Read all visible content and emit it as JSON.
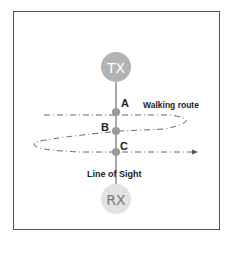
{
  "diagram": {
    "transmitter": {
      "label": "TX",
      "color": "#b3b3b3"
    },
    "receiver": {
      "label": "RX",
      "color": "#e2e2e2",
      "text_color": "#777777"
    },
    "points": [
      {
        "label": "A"
      },
      {
        "label": "B"
      },
      {
        "label": "C"
      }
    ],
    "walking_route_label": "Walking route",
    "line_of_sight_label": "Line of Sight",
    "colors": {
      "line": "#8a8a8a",
      "point": "#9a9a9a",
      "route": "#666666",
      "border": "#555555"
    }
  }
}
